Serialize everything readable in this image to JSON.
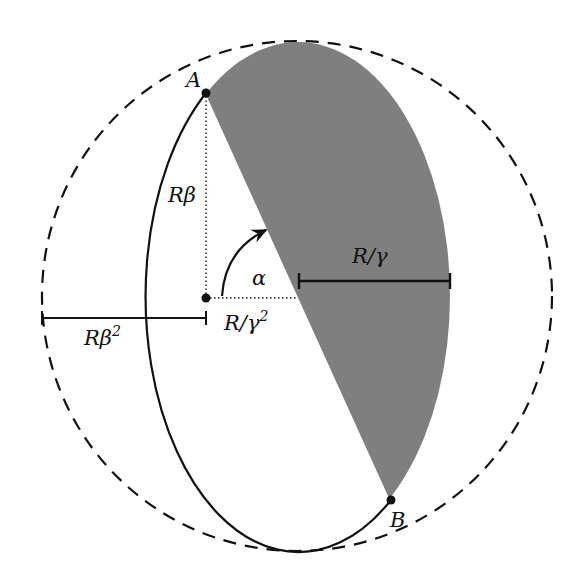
{
  "diagram": {
    "type": "geometry-diagram",
    "colors": {
      "background": "#ffffff",
      "stroke": "#111111",
      "shaded_region": "#7f7f7f"
    },
    "shapes": {
      "dashed_circle": {
        "cx": 297,
        "cy": 296,
        "r": 255,
        "style": "dashed"
      },
      "ellipse": {
        "cx": 298,
        "cy": 296,
        "rx": 152,
        "ry": 254,
        "style": "solid"
      },
      "shaded_region": "right part of ellipse cut by chord A-B",
      "point_A": {
        "x": 206,
        "y": 93
      },
      "point_B": {
        "x": 391,
        "y": 500
      },
      "center_dot": {
        "x": 206,
        "y": 298
      }
    },
    "labels": {
      "point_a": "A",
      "point_b": "B",
      "r_beta": "Rβ",
      "alpha": "α",
      "r_over_gamma": "R/γ",
      "r_over_gamma_sq_base": "R/γ",
      "r_over_gamma_sq_exp": "2",
      "r_beta_sq_base": "Rβ",
      "r_beta_sq_exp": "2"
    }
  }
}
